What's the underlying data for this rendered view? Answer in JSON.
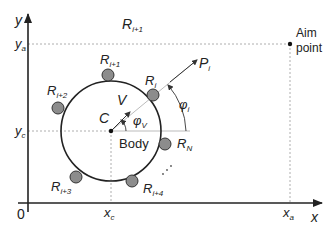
{
  "diagram": {
    "axes": {
      "x_label": "x",
      "y_label": "y",
      "origin_label": "0"
    },
    "coordinates": {
      "ya": {
        "main": "y",
        "sub": "a"
      },
      "yc": {
        "main": "y",
        "sub": "c"
      },
      "xc": {
        "main": "x",
        "sub": "c"
      },
      "xa": {
        "main": "x",
        "sub": "a"
      }
    },
    "region_label": {
      "main": "R",
      "sub": "i+1"
    },
    "aim_point": {
      "line1": "Aim",
      "line2": "point"
    },
    "body": {
      "center_label": "C",
      "body_label": "Body"
    },
    "vectors": {
      "velocity": {
        "main": "V",
        "sub": ""
      },
      "velocity_angle": {
        "main": "φ",
        "sub": "V"
      },
      "direction": {
        "main": "P",
        "sub": "i"
      },
      "direction_angle": {
        "main": "φ",
        "sub": "i"
      }
    },
    "robots": [
      {
        "main": "R",
        "sub": "i+1"
      },
      {
        "main": "R",
        "sub": "i"
      },
      {
        "main": "R",
        "sub": "i+2"
      },
      {
        "main": "R",
        "sub": "N"
      },
      {
        "main": "R",
        "sub": "i+3"
      },
      {
        "main": "R",
        "sub": "i+4"
      }
    ],
    "colors": {
      "line": "#222222",
      "dashed": "#9a9a9a",
      "robot_fill": "#8c8c8c",
      "robot_stroke": "#333333"
    }
  }
}
